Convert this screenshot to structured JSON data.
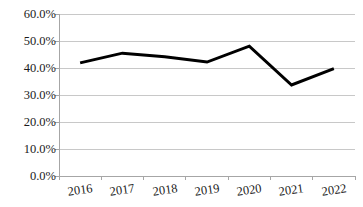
{
  "chart_data": {
    "type": "line",
    "title": "",
    "subtitle": "",
    "xlabel": "",
    "ylabel": "",
    "categories": [
      "2016",
      "2017",
      "2018",
      "2019",
      "2020",
      "2021",
      "2022"
    ],
    "values": [
      41.9,
      45.5,
      44.2,
      42.2,
      48.1,
      33.7,
      39.8
    ],
    "series": [
      {
        "name": "",
        "values": [
          41.9,
          45.5,
          44.2,
          42.2,
          48.1,
          33.7,
          39.8
        ]
      }
    ],
    "ylim": [
      0,
      60
    ],
    "ytick_values": [
      0,
      10,
      20,
      30,
      40,
      50,
      60
    ],
    "ytick_labels": [
      "0.0%",
      "10.0%",
      "20.0%",
      "30.0%",
      "40.0%",
      "50.0%",
      "60.0%"
    ],
    "xtick_labels": [
      "2016",
      "2017",
      "2018",
      "2019",
      "2020",
      "2021",
      "2022"
    ],
    "grid": true,
    "grid_axis": "y",
    "legend": false,
    "legend_position": "none",
    "markers": false,
    "annotations": []
  },
  "style": {
    "line_color": "#000000",
    "line_width": 3,
    "grid_color": "#c8c8c8",
    "axis_color": "#a6a6a6",
    "tick_color": "#a6a6a6",
    "text_color": "#1a1a1a",
    "background": "#ffffff",
    "plot_background": "#ffffff"
  },
  "geometry": {
    "plot_left": 59,
    "plot_right": 355,
    "plot_top": 14,
    "plot_bottom": 176
  }
}
